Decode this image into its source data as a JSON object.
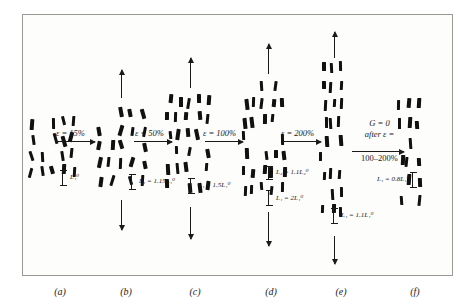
{
  "figure": {
    "panel_letters": [
      "(a)",
      "(b)",
      "(c)",
      "(d)",
      "(e)",
      "(f)"
    ],
    "strain_labels": [
      {
        "id": "ab",
        "text": "ε = 15%"
      },
      {
        "id": "bc",
        "text": "ε = 50%"
      },
      {
        "id": "cd",
        "text": "ε = 100%"
      },
      {
        "id": "de",
        "text": "ε = 200%"
      }
    ],
    "length_labels": [
      {
        "id": "a-L",
        "text": "L₁⁰"
      },
      {
        "id": "b-L",
        "text": "L₁ = 1.15L₁⁰"
      },
      {
        "id": "c-L",
        "text": "L₁ = 1.5L₁⁰"
      },
      {
        "id": "d-L2",
        "text": "L₂ = 1.1L₂⁰"
      },
      {
        "id": "d-L1",
        "text": "L₁ = 2L₁⁰"
      },
      {
        "id": "e-L",
        "text": "L₁ = 1.1L₁⁰"
      },
      {
        "id": "f-L",
        "text": "L₁ = 0.8L₁⁰"
      }
    ],
    "note": {
      "line1": "G = 0",
      "line2": "after ε =",
      "line3": "100–200%"
    }
  },
  "chart_data": {
    "type": "diagram",
    "title": "",
    "panels": [
      {
        "letter": "(a)",
        "state": "undeformed",
        "strain_percent": 0,
        "length_label": "L₁⁰",
        "rod_mean_tilt_deg": 22,
        "rod_count": 17,
        "load_arrows": []
      },
      {
        "letter": "(b)",
        "state": "strained",
        "strain_percent": 15,
        "length_label": "L₁ = 1.15L₁⁰",
        "rod_mean_tilt_deg": 18,
        "rod_count": 17,
        "load_arrows": [
          "up",
          "down"
        ]
      },
      {
        "letter": "(c)",
        "state": "strained",
        "strain_percent": 50,
        "length_label": "L₁ = 1.5L₁⁰",
        "rod_mean_tilt_deg": 12,
        "rod_count": 19,
        "load_arrows": [
          "up",
          "down"
        ]
      },
      {
        "letter": "(d)",
        "state": "strained",
        "strain_percent": 100,
        "length_label_primary": "L₁ = 2L₁⁰",
        "length_label_secondary": "L₂ = 1.1L₂⁰",
        "rod_mean_tilt_deg": 8,
        "rod_count": 21,
        "load_arrows": [
          "up",
          "down"
        ]
      },
      {
        "letter": "(e)",
        "state": "strained",
        "strain_percent": 200,
        "length_label": "L₁ = 1.1L₁⁰",
        "rod_mean_tilt_deg": 4,
        "rod_count": 16,
        "load_arrows": [
          "up",
          "down"
        ]
      },
      {
        "letter": "(f)",
        "state": "relaxed",
        "strain_percent": 0,
        "length_label": "L₁ = 0.8L₁⁰",
        "rod_mean_tilt_deg": 6,
        "rod_count": 12,
        "load_arrows": []
      }
    ],
    "transitions": [
      {
        "from": "(a)",
        "to": "(b)",
        "label": "ε = 15%"
      },
      {
        "from": "(b)",
        "to": "(c)",
        "label": "ε = 50%"
      },
      {
        "from": "(c)",
        "to": "(d)",
        "label": "ε = 100%"
      },
      {
        "from": "(d)",
        "to": "(e)",
        "label": "ε = 200%"
      },
      {
        "from": "(e)",
        "to": "(f)",
        "label": "G = 0 after ε = 100–200%"
      }
    ]
  }
}
